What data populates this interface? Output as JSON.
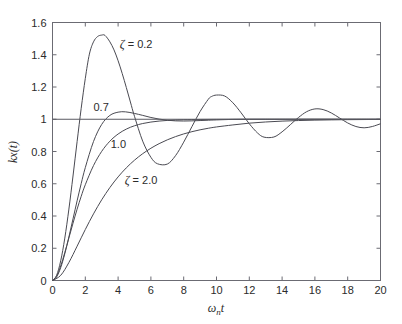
{
  "chart_data": {
    "type": "line",
    "title": "",
    "subtitle": "",
    "xlabel": "ωₙt",
    "ylabel": "kx(t)",
    "xlim": [
      0,
      20
    ],
    "ylim": [
      0,
      1.6
    ],
    "grid": false,
    "legend_position": "inline-annotations",
    "x_ticks": [
      0,
      2,
      4,
      6,
      8,
      10,
      12,
      14,
      16,
      18,
      20
    ],
    "x_tick_labels": [
      "0",
      "2",
      "4",
      "6",
      "8",
      "10",
      "12",
      "14",
      "16",
      "18",
      "20"
    ],
    "y_ticks": [
      0,
      0.2,
      0.4,
      0.6,
      0.8,
      1,
      1.2,
      1.4,
      1.6
    ],
    "y_tick_labels": [
      "0",
      "0.2",
      "0.4",
      "0.6",
      "0.8",
      "1",
      "1.2",
      "1.4",
      "1.6"
    ],
    "reference_line": {
      "name": "steady-state",
      "y": 1.0,
      "x_start": 0.0,
      "x_end": 20.0
    },
    "annotations": [
      {
        "name": "zeta-0-2-label",
        "text": "ζ = 0.2",
        "x": 4.1,
        "y": 1.44
      },
      {
        "name": "zeta-0-7-label",
        "text": "0.7",
        "x": 2.5,
        "y": 1.05
      },
      {
        "name": "zeta-1-0-label",
        "text": "1.0",
        "x": 3.55,
        "y": 0.82
      },
      {
        "name": "zeta-2-0-label",
        "text": "ζ = 2.0",
        "x": 4.4,
        "y": 0.6
      }
    ],
    "series": [
      {
        "name": "ζ = 0.2",
        "damping_ratio": 0.2,
        "peak_value": 1.52,
        "peak_x": 3.2,
        "x": [
          0,
          0.25,
          0.5,
          0.75,
          1,
          1.25,
          1.5,
          1.75,
          2,
          2.25,
          2.5,
          2.75,
          3,
          3.2,
          3.5,
          3.75,
          4,
          4.25,
          4.5,
          4.75,
          5,
          5.5,
          6,
          6.4,
          7,
          7.5,
          8,
          8.5,
          9,
          9.5,
          9.7,
          10,
          10.5,
          11,
          11.5,
          12,
          12.5,
          12.9,
          13.5,
          14,
          14.5,
          15,
          15.5,
          16,
          16.5,
          17,
          17.5,
          18,
          18.5,
          19,
          19.5,
          20
        ],
        "y": [
          0,
          0.032,
          0.122,
          0.263,
          0.443,
          0.648,
          0.861,
          1.068,
          1.253,
          1.404,
          1.48,
          1.513,
          1.522,
          1.52,
          1.48,
          1.43,
          1.363,
          1.284,
          1.197,
          1.107,
          1.018,
          0.864,
          0.764,
          0.724,
          0.722,
          0.774,
          0.858,
          0.954,
          1.048,
          1.124,
          1.141,
          1.15,
          1.144,
          1.102,
          1.04,
          0.972,
          0.915,
          0.889,
          0.89,
          0.922,
          0.966,
          1.011,
          1.047,
          1.064,
          1.06,
          1.039,
          1.008,
          0.977,
          0.955,
          0.947,
          0.955,
          0.972
        ]
      },
      {
        "name": "0.7",
        "damping_ratio": 0.7,
        "peak_value": 1.046,
        "peak_x": 4.45,
        "x": [
          0,
          0.25,
          0.5,
          0.75,
          1,
          1.25,
          1.5,
          1.75,
          2,
          2.5,
          3,
          3.5,
          4,
          4.45,
          5,
          5.5,
          6,
          6.5,
          7,
          7.5,
          8,
          8.5,
          9,
          9.5,
          10,
          11,
          12,
          13,
          14,
          15,
          16,
          17,
          18,
          19,
          20
        ],
        "y": [
          0,
          0.022,
          0.08,
          0.166,
          0.27,
          0.382,
          0.494,
          0.601,
          0.7,
          0.862,
          0.968,
          1.024,
          1.044,
          1.046,
          1.036,
          1.024,
          1.011,
          1.001,
          0.994,
          0.99,
          0.989,
          0.99,
          0.992,
          0.994,
          0.996,
          0.999,
          1.0,
          1.0,
          1.0,
          1.0,
          1.0,
          1.0,
          1.0,
          1.0,
          1.0
        ]
      },
      {
        "name": "1.0",
        "damping_ratio": 1.0,
        "peak_value": 1.0,
        "peak_x": 20,
        "x": [
          0,
          0.25,
          0.5,
          0.75,
          1,
          1.25,
          1.5,
          1.75,
          2,
          2.5,
          3,
          3.5,
          4,
          4.5,
          5,
          5.5,
          6,
          6.5,
          7,
          7.5,
          8,
          9,
          10,
          11,
          12,
          13,
          14,
          16,
          18,
          20
        ],
        "y": [
          0,
          0.0265,
          0.0902,
          0.1734,
          0.2642,
          0.3554,
          0.4422,
          0.5221,
          0.594,
          0.7127,
          0.8009,
          0.8641,
          0.9084,
          0.9389,
          0.9596,
          0.9735,
          0.9826,
          0.9887,
          0.9927,
          0.9953,
          0.997,
          0.9988,
          0.9995,
          0.9998,
          0.9999,
          1.0,
          1.0,
          1.0,
          1.0,
          1.0
        ]
      },
      {
        "name": "ζ = 2.0",
        "damping_ratio": 2.0,
        "peak_value": 1.0,
        "peak_x": 20,
        "x": [
          0,
          0.5,
          1,
          1.5,
          2,
          2.5,
          3,
          3.5,
          4,
          4.5,
          5,
          5.5,
          6,
          6.5,
          7,
          7.5,
          8,
          8.5,
          9,
          9.5,
          10,
          11,
          12,
          13,
          14,
          15,
          16,
          17,
          18,
          19,
          20
        ],
        "y": [
          0,
          0.0318,
          0.1118,
          0.2128,
          0.3161,
          0.4132,
          0.5004,
          0.5767,
          0.6425,
          0.6986,
          0.7462,
          0.7864,
          0.8202,
          0.8486,
          0.8724,
          0.8923,
          0.909,
          0.9229,
          0.9345,
          0.9442,
          0.9523,
          0.9648,
          0.9758,
          0.9831,
          0.9884,
          0.992,
          0.9945,
          0.9962,
          0.9974,
          0.9982,
          0.9988
        ]
      }
    ]
  },
  "colors": {
    "background": "#ffffff",
    "curve": "#4a4a52",
    "axis": "#6b6b73",
    "text": "#2b2b2b"
  }
}
